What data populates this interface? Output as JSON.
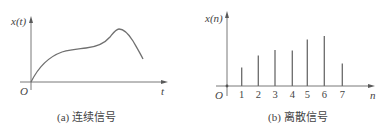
{
  "chart_data": [
    {
      "type": "line",
      "title": "(a) 连续信号",
      "xlabel": "t",
      "ylabel": "x(t)",
      "origin_label": "O",
      "grid": false,
      "description": "Continuous signal rising from origin, plateau, peak, then falling",
      "x": [
        0,
        0.1,
        0.2,
        0.3,
        0.4,
        0.5,
        0.6,
        0.7,
        0.75,
        0.8,
        0.9,
        1.0
      ],
      "values": [
        0,
        0.35,
        0.55,
        0.63,
        0.65,
        0.67,
        0.72,
        0.88,
        0.96,
        0.92,
        0.7,
        0.4
      ]
    },
    {
      "type": "bar",
      "subtype": "stem",
      "title": "(b) 离散信号",
      "xlabel": "n",
      "ylabel": "x(n)",
      "origin_label": "O",
      "grid": false,
      "categories": [
        "1",
        "2",
        "3",
        "4",
        "5",
        "6",
        "7"
      ],
      "values": [
        0.37,
        0.61,
        0.72,
        0.71,
        0.93,
        1.0,
        0.45
      ],
      "ylim": [
        0,
        1.5
      ]
    }
  ],
  "left": {
    "ylabel": "x(t)",
    "xlabel": "t",
    "origin": "O",
    "caption": "(a) 连续信号"
  },
  "right": {
    "ylabel": "x(n)",
    "xlabel": "n",
    "origin": "O",
    "caption": "(b) 离散信号",
    "ticks": [
      "1",
      "2",
      "3",
      "4",
      "5",
      "6",
      "7"
    ]
  },
  "colors": {
    "axis": "#6a6a6a",
    "line": "#707070",
    "text": "#444444"
  }
}
